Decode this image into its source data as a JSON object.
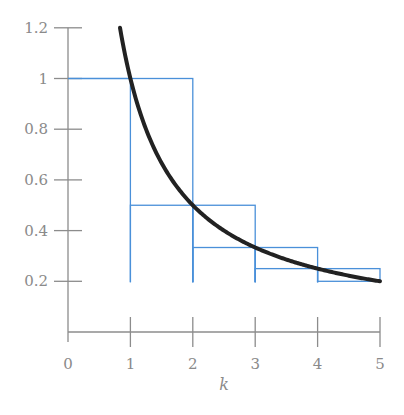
{
  "chart_data": {
    "type": "line",
    "title": "",
    "xlabel": "k",
    "ylabel": "",
    "xlim": [
      0,
      5
    ],
    "ylim": [
      0,
      1.2
    ],
    "grid": false,
    "legend": null,
    "x_ticks": [
      "0",
      "1",
      "2",
      "3",
      "4",
      "5"
    ],
    "y_ticks": [
      "0.2",
      "0.4",
      "0.6",
      "0.8",
      "1",
      "1.2"
    ],
    "series": [
      {
        "name": "curve 1/x",
        "kind": "curve",
        "color": "#222222",
        "x_range": [
          0.833,
          5
        ],
        "function": "1/x",
        "points": [
          [
            0.833,
            1.2
          ],
          [
            1,
            1
          ],
          [
            1.5,
            0.667
          ],
          [
            2,
            0.5
          ],
          [
            3,
            0.333
          ],
          [
            4,
            0.25
          ],
          [
            5,
            0.2
          ]
        ]
      },
      {
        "name": "left-endpoint rectangles",
        "kind": "step",
        "color": "#4a90d9",
        "intervals": [
          [
            1,
            2
          ],
          [
            2,
            3
          ],
          [
            3,
            4
          ],
          [
            4,
            5
          ]
        ],
        "heights": [
          1,
          0.5,
          0.3333,
          0.25
        ]
      },
      {
        "name": "right-endpoint rectangles",
        "kind": "step",
        "color": "#4a90d9",
        "intervals": [
          [
            1,
            2
          ],
          [
            2,
            3
          ],
          [
            3,
            4
          ],
          [
            4,
            5
          ]
        ],
        "heights": [
          0.5,
          0.3333,
          0.25,
          0.2
        ]
      }
    ],
    "extra_lines": [
      {
        "from": [
          0,
          1
        ],
        "to": [
          1,
          1
        ],
        "color": "#4a90d9",
        "note": "horizontal line from y-axis at y=1"
      }
    ]
  },
  "labels": {
    "x_ticks": [
      "0",
      "1",
      "2",
      "3",
      "4",
      "5"
    ],
    "y_ticks": [
      "0.2",
      "0.4",
      "0.6",
      "0.8",
      "1",
      "1.2"
    ],
    "xlabel": "k"
  }
}
